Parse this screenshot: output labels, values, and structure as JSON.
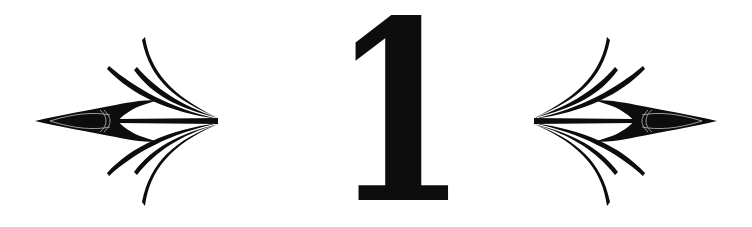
{
  "heading": {
    "numeral": "1",
    "ornaments": [
      "left-arrow-flourish",
      "right-arrow-flourish"
    ]
  },
  "colors": {
    "ink": "#0d0d0d",
    "background": "#ffffff"
  }
}
